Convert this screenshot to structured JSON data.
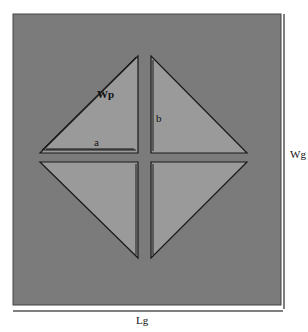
{
  "diagram": {
    "type": "antenna-layout",
    "colors": {
      "background": "#ffffff",
      "ground_plane": "#7b7b7b",
      "patch_fill": "#9a9a9a",
      "outline": "#1a1a1a",
      "dimension_line": "#555555"
    },
    "ground_plane": {
      "x": 13,
      "y": 14,
      "width": 268,
      "height": 291
    },
    "patches": [
      {
        "name": "top-left-triangle",
        "points": "40,152 138,56 138,152"
      },
      {
        "name": "top-right-triangle",
        "points": "151,56 151,152 247,152"
      },
      {
        "name": "bottom-left-triangle",
        "points": "40,162 138,162 138,257"
      },
      {
        "name": "bottom-right-triangle",
        "points": "151,162 247,162 151,257"
      }
    ],
    "labels": {
      "wp": "Wp",
      "a": "a",
      "b": "b",
      "wg": "Wg",
      "lg": "Lg"
    }
  }
}
